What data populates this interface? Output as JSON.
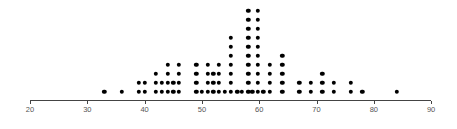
{
  "chart_data": {
    "type": "scatter",
    "subtype": "dot-plot",
    "title": "",
    "xlabel": "",
    "ylabel": "",
    "xlim": [
      20,
      90
    ],
    "x_ticks": [
      20,
      30,
      40,
      50,
      60,
      70,
      80,
      90
    ],
    "grid": false,
    "legend": null,
    "columns": [
      {
        "value": 33,
        "count": 1
      },
      {
        "value": 36,
        "count": 1
      },
      {
        "value": 39,
        "count": 2
      },
      {
        "value": 40,
        "count": 2
      },
      {
        "value": 42,
        "count": 3
      },
      {
        "value": 43,
        "count": 2
      },
      {
        "value": 44,
        "count": 4
      },
      {
        "value": 45,
        "count": 2
      },
      {
        "value": 46,
        "count": 4
      },
      {
        "value": 49,
        "count": 4
      },
      {
        "value": 50,
        "count": 1
      },
      {
        "value": 51,
        "count": 4
      },
      {
        "value": 52,
        "count": 3
      },
      {
        "value": 53,
        "count": 4
      },
      {
        "value": 54,
        "count": 1
      },
      {
        "value": 55,
        "count": 7
      },
      {
        "value": 56.2,
        "count": 1
      },
      {
        "value": 57,
        "count": 1
      },
      {
        "value": 58.1,
        "count": 10
      },
      {
        "value": 58.8,
        "count": 1
      },
      {
        "value": 59.8,
        "count": 10
      },
      {
        "value": 60.7,
        "count": 1
      },
      {
        "value": 61.8,
        "count": 4
      },
      {
        "value": 64,
        "count": 5
      },
      {
        "value": 67,
        "count": 2
      },
      {
        "value": 69,
        "count": 2
      },
      {
        "value": 71,
        "count": 3
      },
      {
        "value": 73,
        "count": 2
      },
      {
        "value": 76,
        "count": 2
      },
      {
        "value": 78,
        "count": 1
      },
      {
        "value": 84,
        "count": 1
      }
    ]
  },
  "layout": {
    "x_px_at_20": 30,
    "px_per_unit": 5.73,
    "axis_y": 100,
    "dot_base_y": 92,
    "dot_step_y": 9,
    "dot_color": "#000000",
    "axis_color": "#444444"
  }
}
